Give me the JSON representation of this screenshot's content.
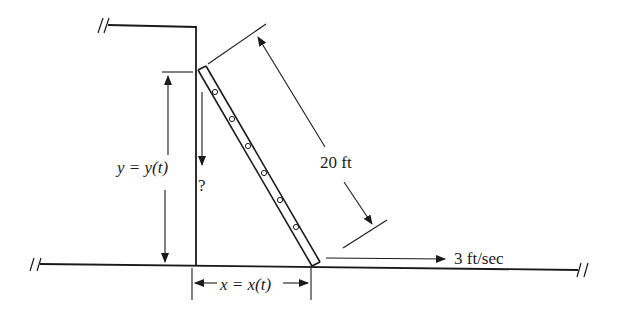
{
  "diagram": {
    "type": "related-rates ladder problem",
    "labels": {
      "ladder_length": "20 ft",
      "height_label": "y = y(t)",
      "distance_label": "x = x(t)",
      "unknown_rate": "?",
      "bottom_speed": "3 ft/sec"
    },
    "elements": [
      "wall",
      "ground",
      "ladder",
      "ladder-length-dimension",
      "height-dimension",
      "base-distance-dimension",
      "velocity-arrow",
      "downward-rate-arrow",
      "break-marks"
    ],
    "colors": {
      "ink": "#1a1a1a",
      "background": "#ffffff"
    }
  }
}
